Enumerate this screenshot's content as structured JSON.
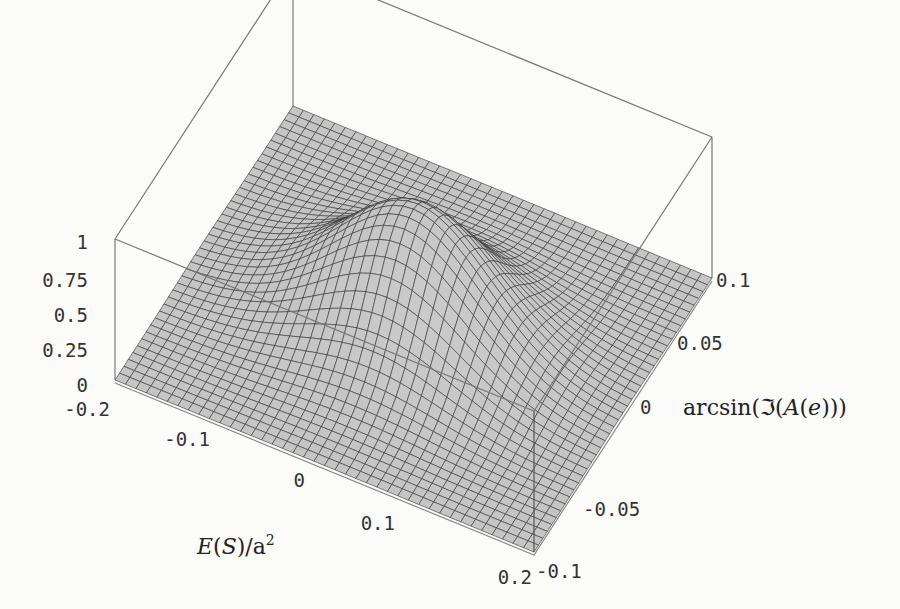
{
  "chart_data": {
    "type": "surface3d",
    "title": "",
    "x_axis": {
      "label": "E(S)/a²",
      "range": [
        -0.2,
        0.2
      ],
      "ticks": [
        "-0.2",
        "-0.1",
        "0",
        "0.1",
        "0.2"
      ]
    },
    "y_axis": {
      "label": "arcsin(ℑ(A(e)))",
      "range": [
        -0.1,
        0.1
      ],
      "ticks": [
        "-0.1",
        "-0.05",
        "0",
        "0.05",
        "0.1"
      ]
    },
    "z_axis": {
      "label": "",
      "range": [
        0,
        1
      ],
      "ticks": [
        "0",
        "0.25",
        "0.5",
        "0.75",
        "1"
      ]
    },
    "surface": {
      "description": "Single Gaussian-like peak near the origin, elongated along E(S)/a², with flat plateau at 0 elsewhere",
      "peak": {
        "x": 0.0,
        "y": 0.0,
        "z": 0.85
      },
      "sigma_x": 0.07,
      "sigma_y": 0.03,
      "grid": 40
    },
    "box": true,
    "mesh": true
  }
}
